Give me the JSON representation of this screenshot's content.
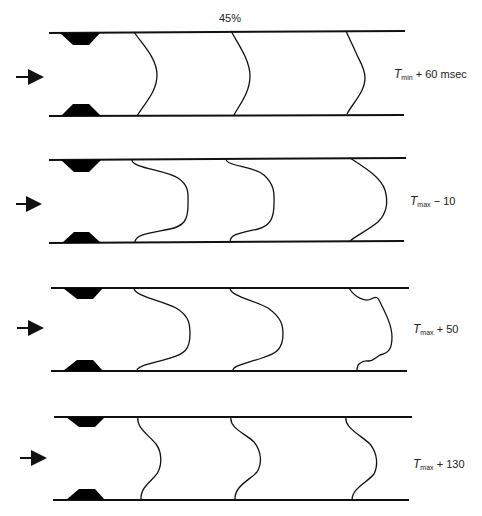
{
  "figure": {
    "stenosis_label": "45%",
    "colors": {
      "line": "#111111",
      "stenosis_fill": "#000000",
      "background": "#ffffff"
    },
    "flow_direction": "left-to-right",
    "panels": [
      {
        "id": "p1",
        "label": {
          "symbol": "T",
          "subscript": "min",
          "operator": "+",
          "value": "60 msec"
        },
        "y_top": 32,
        "y_bottom": 116
      },
      {
        "id": "p2",
        "label": {
          "symbol": "T",
          "subscript": "max",
          "operator": "−",
          "value": "10"
        },
        "y_top": 159,
        "y_bottom": 242
      },
      {
        "id": "p3",
        "label": {
          "symbol": "T",
          "subscript": "max",
          "operator": "+",
          "value": "50"
        },
        "y_top": 288,
        "y_bottom": 371
      },
      {
        "id": "p4",
        "label": {
          "symbol": "T",
          "subscript": "max",
          "operator": "+",
          "value": "130"
        },
        "y_top": 417,
        "y_bottom": 500
      }
    ]
  }
}
